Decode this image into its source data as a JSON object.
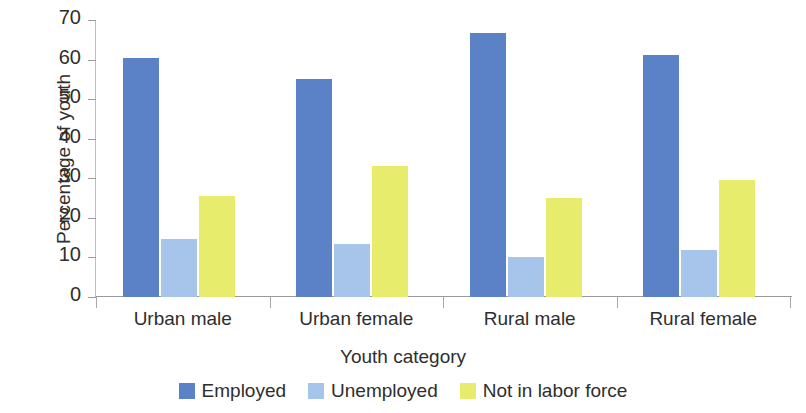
{
  "chart_data": {
    "type": "bar",
    "title": "",
    "xlabel": "Youth category",
    "ylabel": "Percentage of youth",
    "categories": [
      "Urban male",
      "Urban female",
      "Rural male",
      "Rural female"
    ],
    "series": [
      {
        "name": "Employed",
        "color": "#5b82c6",
        "values": [
          60.3,
          55.2,
          66.8,
          61.2
        ]
      },
      {
        "name": "Unemployed",
        "color": "#a7c4ea",
        "values": [
          14.7,
          13.3,
          10.1,
          11.9
        ]
      },
      {
        "name": "Not in labor force",
        "color": "#e7ec6d",
        "values": [
          25.5,
          33.0,
          25.1,
          29.6
        ]
      }
    ],
    "ylim": [
      0,
      70
    ],
    "yticks": [
      0,
      10,
      20,
      30,
      40,
      50,
      60,
      70
    ],
    "ytick_labels": [
      "0",
      "10",
      "20",
      "30",
      "40",
      "50",
      "60",
      "70"
    ],
    "grid": false,
    "legend_position": "bottom"
  }
}
